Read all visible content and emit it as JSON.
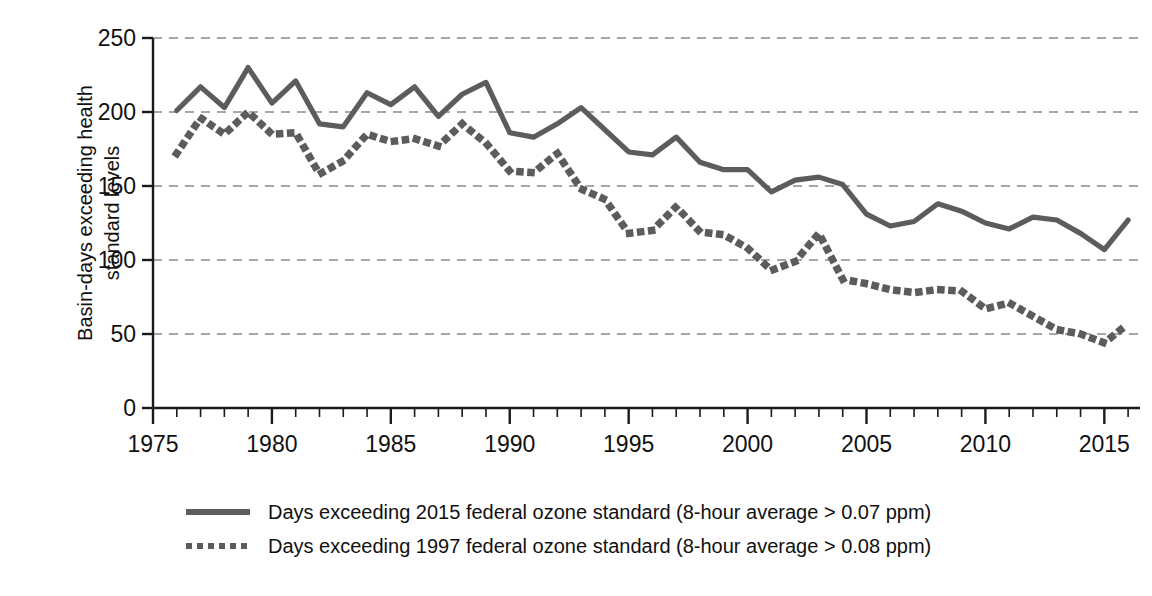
{
  "chart_data": {
    "type": "line",
    "title": "",
    "xlabel": "",
    "ylabel": "Basin-days exceeding health\nstandard levels",
    "xlim": [
      1975,
      2016.5
    ],
    "ylim": [
      0,
      250
    ],
    "yticks": [
      0,
      50,
      100,
      150,
      200,
      250
    ],
    "xticks": [
      1975,
      1980,
      1985,
      1990,
      1995,
      2000,
      2005,
      2010,
      2015
    ],
    "xtick_minor_step": 1,
    "grid": "horizontal-dashed",
    "legend_position": "below",
    "x": [
      1976,
      1977,
      1978,
      1979,
      1980,
      1981,
      1982,
      1983,
      1984,
      1985,
      1986,
      1987,
      1988,
      1989,
      1990,
      1991,
      1992,
      1993,
      1994,
      1995,
      1996,
      1997,
      1998,
      1999,
      2000,
      2001,
      2002,
      2003,
      2004,
      2005,
      2006,
      2007,
      2008,
      2009,
      2010,
      2011,
      2012,
      2013,
      2014,
      2015,
      2016
    ],
    "series": [
      {
        "name": "Days exceeding 2015 federal ozone standard (8-hour average > 0.07 ppm)",
        "style": "solid",
        "color": "#5c5c5c",
        "values": [
          201,
          217,
          203,
          230,
          206,
          221,
          192,
          190,
          213,
          205,
          217,
          197,
          212,
          220,
          186,
          183,
          192,
          203,
          188,
          173,
          171,
          183,
          166,
          161,
          161,
          146,
          154,
          156,
          151,
          131,
          123,
          126,
          138,
          133,
          125,
          121,
          129,
          127,
          118,
          107,
          127
        ]
      },
      {
        "name": "Days exceeding 1997 federal ozone standard (8-hour average > 0.08 ppm)",
        "style": "dotted",
        "color": "#5c5c5c",
        "values": [
          172,
          196,
          185,
          200,
          185,
          186,
          158,
          167,
          185,
          180,
          182,
          177,
          192,
          179,
          160,
          159,
          172,
          148,
          141,
          118,
          120,
          136,
          119,
          117,
          108,
          93,
          99,
          118,
          87,
          84,
          80,
          78,
          80,
          79,
          67,
          71,
          62,
          53,
          50,
          44,
          57
        ]
      }
    ]
  },
  "axis": {
    "y_tick_labels": [
      "250",
      "200",
      "150",
      "100",
      "50",
      "0"
    ],
    "x_tick_labels": [
      "1975",
      "1980",
      "1985",
      "1990",
      "1995",
      "2000",
      "2005",
      "2010",
      "2015"
    ],
    "y_axis_title": "Basin-days exceeding health\nstandard levels"
  },
  "legend": {
    "items": [
      {
        "key": "solid-line-swatch",
        "label": "Days exceeding 2015 federal ozone standard (8-hour average > 0.07 ppm)"
      },
      {
        "key": "dotted-line-swatch",
        "label": "Days exceeding 1997 federal ozone standard (8-hour average > 0.08 ppm)"
      }
    ]
  },
  "colors": {
    "series": "#5c5c5c",
    "axis": "#1a1a1a",
    "grid": "#8a8a8a",
    "background": "#ffffff"
  }
}
